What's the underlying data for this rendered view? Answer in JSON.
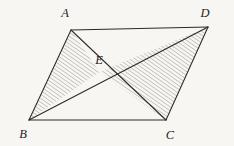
{
  "figure": {
    "kind": "geometry-diagram",
    "background_color": "#f7f6f3",
    "stroke_color": "#2e2a26",
    "hatch_color": "#8e8b86",
    "label_color": "#25211e",
    "hatch_angle_deg": 55,
    "points": {
      "A": {
        "label": "A",
        "x": 71,
        "y": 30,
        "label_x": 65,
        "label_y": 17
      },
      "B": {
        "label": "B",
        "x": 29,
        "y": 120,
        "label_x": 23,
        "label_y": 138
      },
      "C": {
        "label": "C",
        "x": 166,
        "y": 120,
        "label_x": 170,
        "label_y": 139
      },
      "D": {
        "label": "D",
        "x": 208,
        "y": 27,
        "label_x": 205,
        "label_y": 17
      },
      "E": {
        "label": "E",
        "x": 99.5,
        "y": 72,
        "label_x": 99,
        "label_y": 64
      }
    },
    "edges": [
      {
        "name": "AD",
        "from": "A",
        "to": "D"
      },
      {
        "name": "BC",
        "from": "B",
        "to": "C"
      },
      {
        "name": "AB",
        "from": "A",
        "to": "B"
      },
      {
        "name": "CD",
        "from": "C",
        "to": "D"
      },
      {
        "name": "BD",
        "from": "B",
        "to": "D"
      },
      {
        "name": "AC",
        "from": "A",
        "to": "C"
      }
    ],
    "shaded_regions": [
      {
        "name": "triangle-ABE",
        "vertices": [
          "A",
          "B",
          "E"
        ]
      },
      {
        "name": "triangle-ECD",
        "vertices": [
          "E",
          "C",
          "D"
        ]
      }
    ]
  }
}
